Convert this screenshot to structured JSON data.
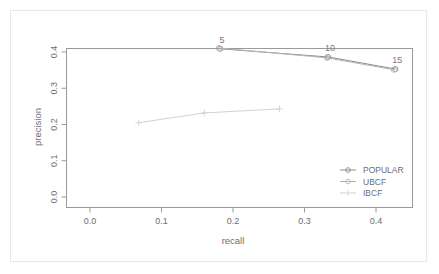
{
  "chart_data": {
    "type": "line",
    "title": "",
    "xlabel": "recall",
    "ylabel": "precision",
    "xlim": [
      0.0,
      0.48
    ],
    "ylim": [
      0.0,
      0.44
    ],
    "xticks": [
      "0.0",
      "0.1",
      "0.2",
      "0.3",
      "0.4"
    ],
    "xtick_values": [
      0.0,
      0.1,
      0.2,
      0.3,
      0.4
    ],
    "yticks": [
      "0.0",
      "0.1",
      "0.2",
      "0.3",
      "0.4"
    ],
    "ytick_values": [
      0.0,
      0.1,
      0.2,
      0.3,
      0.4
    ],
    "grid": false,
    "legend_position": "bottom-right",
    "point_labels": [
      "5",
      "10",
      "15"
    ],
    "series": [
      {
        "name": "POPULAR",
        "marker": "circle",
        "color": "#8a8a8a",
        "x": [
          0.182,
          0.333,
          0.427
        ],
        "y": [
          0.409,
          0.386,
          0.353
        ]
      },
      {
        "name": "UBCF",
        "marker": "circle",
        "color": "#b5b5b5",
        "x": [
          0.18,
          0.331,
          0.425
        ],
        "y": [
          0.411,
          0.384,
          0.351
        ]
      },
      {
        "name": "IBCF",
        "marker": "plus",
        "color": "#d2d2d2",
        "x": [
          0.068,
          0.16,
          0.265
        ],
        "y": [
          0.205,
          0.232,
          0.243
        ]
      }
    ]
  },
  "legend": {
    "entries": [
      {
        "label": "POPULAR",
        "marker": "circle",
        "color": "#8a8a8a"
      },
      {
        "label": "UBCF",
        "marker": "circle",
        "color": "#b5b5b5"
      },
      {
        "label": "IBCF",
        "marker": "plus",
        "color": "#d2d2d2"
      }
    ]
  },
  "axes": {
    "x_title": "recall",
    "y_title": "precision"
  }
}
